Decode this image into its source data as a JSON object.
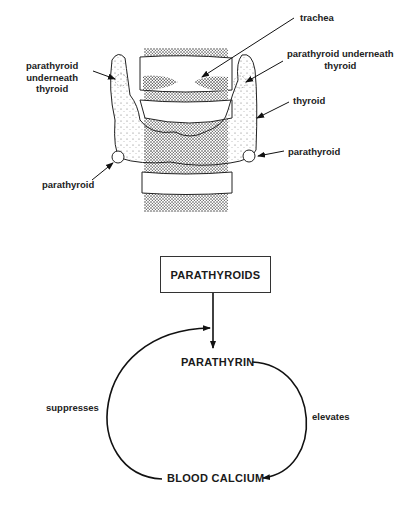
{
  "anatomy": {
    "labels": {
      "trachea": "trachea",
      "parathyroid_underneath_right_l1": "parathyroid underneath",
      "parathyroid_underneath_right_l2": "thyroid",
      "parathyroid_underneath_left_l1": "parathyroid",
      "parathyroid_underneath_left_l2": "underneath",
      "parathyroid_underneath_left_l3": "thyroid",
      "thyroid": "thyroid",
      "parathyroid_right": "parathyroid",
      "parathyroid_left": "parathyroid"
    }
  },
  "flow": {
    "source": "PARATHYROIDS",
    "hormone": "PARATHYRIN",
    "target": "BLOOD CALCIUM",
    "edge_elevates": "elevates",
    "edge_suppresses": "suppresses"
  }
}
